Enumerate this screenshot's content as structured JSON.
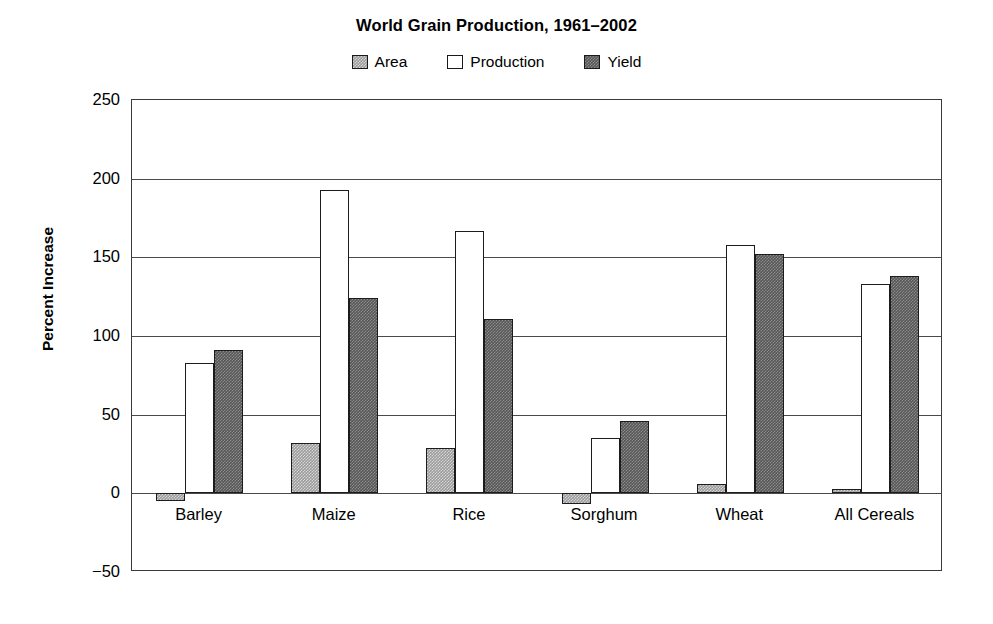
{
  "chart_data": {
    "type": "bar",
    "title": "World Grain Production, 1961–2002",
    "xlabel": "",
    "ylabel": "Percent Increase",
    "ylim": [
      -50,
      250
    ],
    "ytick_step": 50,
    "yticks": [
      250,
      200,
      150,
      100,
      50,
      0,
      -50
    ],
    "ytick_labels": [
      "250",
      "200",
      "150",
      "100",
      "50",
      "0",
      "−50"
    ],
    "grid": true,
    "legend_position": "top-center",
    "categories": [
      "Barley",
      "Maize",
      "Rice",
      "Sorghum",
      "Wheat",
      "All Cereals"
    ],
    "series": [
      {
        "name": "Area",
        "color": "#9a9a9a",
        "fill": "light-dither",
        "values": [
          -5,
          32,
          29,
          -7,
          6,
          3
        ]
      },
      {
        "name": "Production",
        "color": "#ffffff",
        "fill": "white",
        "values": [
          83,
          193,
          167,
          35,
          158,
          133
        ]
      },
      {
        "name": "Yield",
        "color": "#565656",
        "fill": "dark-dither",
        "values": [
          91,
          124,
          111,
          46,
          152,
          138
        ]
      }
    ]
  },
  "legend": {
    "items": [
      {
        "label": "Area",
        "swatch": "light-dither"
      },
      {
        "label": "Production",
        "swatch": "white"
      },
      {
        "label": "Yield",
        "swatch": "dark-dither"
      }
    ]
  }
}
